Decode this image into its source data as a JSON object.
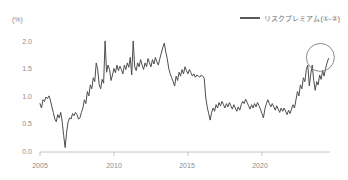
{
  "chart_data": {
    "type": "line",
    "title": "",
    "subtitle": "",
    "xlabel": "",
    "ylabel": "(%)",
    "yunit_label": "(%)",
    "grid": false,
    "legend_position": "top-right",
    "xlim": [
      2005.0,
      2024.6
    ],
    "ylim": [
      0.0,
      2.2
    ],
    "ytick_labels": [
      "0.0",
      "0.5",
      "1.0",
      "1.5",
      "2.0"
    ],
    "ytick_values": [
      0.0,
      0.5,
      1.0,
      1.5,
      2.0
    ],
    "xtick_labels": [
      "2005",
      "2010",
      "2015",
      "2020"
    ],
    "xtick_values": [
      2005,
      2010,
      2015,
      2020
    ],
    "series": [
      {
        "name": "リスクプレミアム(①-②)",
        "color": "#4d4d4d",
        "x": [
          2005.0,
          2005.1,
          2005.2,
          2005.3,
          2005.4,
          2005.5,
          2005.6,
          2005.7,
          2005.8,
          2005.9,
          2006.0,
          2006.1,
          2006.2,
          2006.3,
          2006.4,
          2006.5,
          2006.6,
          2006.7,
          2006.8,
          2006.9,
          2007.0,
          2007.1,
          2007.2,
          2007.3,
          2007.4,
          2007.5,
          2007.6,
          2007.7,
          2007.8,
          2007.9,
          2008.0,
          2008.1,
          2008.2,
          2008.3,
          2008.4,
          2008.5,
          2008.6,
          2008.7,
          2008.8,
          2008.9,
          2009.0,
          2009.1,
          2009.2,
          2009.3,
          2009.4,
          2009.5,
          2009.6,
          2009.7,
          2009.8,
          2009.9,
          2010.0,
          2010.1,
          2010.2,
          2010.3,
          2010.4,
          2010.5,
          2010.6,
          2010.7,
          2010.8,
          2010.9,
          2011.0,
          2011.1,
          2011.2,
          2011.3,
          2011.4,
          2011.5,
          2011.6,
          2011.7,
          2011.8,
          2011.9,
          2012.0,
          2012.1,
          2012.2,
          2012.3,
          2012.4,
          2012.5,
          2012.6,
          2012.7,
          2012.8,
          2012.9,
          2013.0,
          2013.1,
          2013.2,
          2013.3,
          2013.4,
          2013.5,
          2013.6,
          2013.7,
          2013.8,
          2013.9,
          2014.0,
          2014.1,
          2014.2,
          2014.3,
          2014.4,
          2014.5,
          2014.6,
          2014.7,
          2014.8,
          2014.9,
          2015.0,
          2015.1,
          2015.2,
          2015.3,
          2015.4,
          2015.5,
          2015.6,
          2015.7,
          2015.8,
          2015.9,
          2016.0,
          2016.1,
          2016.2,
          2016.3,
          2016.4,
          2016.5,
          2016.6,
          2016.7,
          2016.8,
          2016.9,
          2017.0,
          2017.1,
          2017.2,
          2017.3,
          2017.4,
          2017.5,
          2017.6,
          2017.7,
          2017.8,
          2017.9,
          2018.0,
          2018.1,
          2018.2,
          2018.3,
          2018.4,
          2018.5,
          2018.6,
          2018.7,
          2018.8,
          2018.9,
          2019.0,
          2019.1,
          2019.2,
          2019.3,
          2019.4,
          2019.5,
          2019.6,
          2019.7,
          2019.8,
          2019.9,
          2020.0,
          2020.1,
          2020.2,
          2020.3,
          2020.4,
          2020.5,
          2020.6,
          2020.7,
          2020.8,
          2020.9,
          2021.0,
          2021.1,
          2021.2,
          2021.3,
          2021.4,
          2021.5,
          2021.6,
          2021.7,
          2021.8,
          2021.9,
          2022.0,
          2022.1,
          2022.2,
          2022.3,
          2022.4,
          2022.5,
          2022.6,
          2022.7,
          2022.8,
          2022.9,
          2023.0,
          2023.1,
          2023.2,
          2023.3,
          2023.4,
          2023.5,
          2023.6,
          2023.7,
          2023.8,
          2023.9,
          2024.0,
          2024.1,
          2024.2,
          2024.3,
          2024.4,
          2024.5
        ],
        "values": [
          0.88,
          0.8,
          0.95,
          0.92,
          1.0,
          0.97,
          1.02,
          0.95,
          0.82,
          0.72,
          0.6,
          0.55,
          0.68,
          0.62,
          0.72,
          0.55,
          0.3,
          0.08,
          0.36,
          0.55,
          0.62,
          0.6,
          0.7,
          0.66,
          0.72,
          0.68,
          0.6,
          0.62,
          0.72,
          0.8,
          0.95,
          0.88,
          1.1,
          1.02,
          1.22,
          1.15,
          1.35,
          1.28,
          1.62,
          1.5,
          1.22,
          1.15,
          1.32,
          1.25,
          2.02,
          1.45,
          1.58,
          1.5,
          1.3,
          1.4,
          1.52,
          1.44,
          1.58,
          1.48,
          1.56,
          1.5,
          1.42,
          1.58,
          1.5,
          1.62,
          1.54,
          1.72,
          1.4,
          2.02,
          1.55,
          1.48,
          1.62,
          1.55,
          1.68,
          1.58,
          1.5,
          1.62,
          1.55,
          1.7,
          1.62,
          1.55,
          1.68,
          1.6,
          1.72,
          1.64,
          1.58,
          1.7,
          1.8,
          1.9,
          1.98,
          1.82,
          1.7,
          1.52,
          1.42,
          1.35,
          1.28,
          1.2,
          1.38,
          1.3,
          1.45,
          1.38,
          1.5,
          1.42,
          1.55,
          1.48,
          1.42,
          1.5,
          1.44,
          1.38,
          1.42,
          1.36,
          1.4,
          1.38,
          1.36,
          1.4,
          1.38,
          1.34,
          1.0,
          0.82,
          0.7,
          0.58,
          0.72,
          0.8,
          0.74,
          0.86,
          0.8,
          0.9,
          0.84,
          0.92,
          0.86,
          0.8,
          0.88,
          0.82,
          0.9,
          0.84,
          0.78,
          0.86,
          0.8,
          0.74,
          0.82,
          0.76,
          0.86,
          0.92,
          0.88,
          0.96,
          0.9,
          0.84,
          0.78,
          0.86,
          0.8,
          0.88,
          0.82,
          0.9,
          0.84,
          0.78,
          0.7,
          0.62,
          0.78,
          0.88,
          0.95,
          0.88,
          0.82,
          0.88,
          0.82,
          0.76,
          0.84,
          0.78,
          0.72,
          0.8,
          0.74,
          0.8,
          0.74,
          0.68,
          0.76,
          0.7,
          0.78,
          0.86,
          0.8,
          0.95,
          1.1,
          1.02,
          1.22,
          1.15,
          1.35,
          1.28,
          1.5,
          1.58,
          1.2,
          1.42,
          1.58,
          1.3,
          1.12,
          1.28,
          1.22,
          1.4,
          1.32,
          1.48,
          1.38,
          1.52,
          1.62,
          1.7
        ]
      }
    ],
    "annotations": [
      {
        "type": "ellipse",
        "name": "highlight-circle",
        "center_x": 2023.95,
        "center_y": 1.72,
        "radius_px": 14,
        "color": "#8c8c8c"
      }
    ]
  },
  "legend": {
    "items": [
      {
        "label": "リスクプレミアム(①-②)",
        "color": "#4d4d4d"
      }
    ]
  },
  "axes": {
    "y_unit": "(%)",
    "y_ticks": [
      "2.0",
      "1.5",
      "1.0",
      "0.5",
      "0.0"
    ],
    "x_ticks": [
      "2005",
      "2010",
      "2015",
      "2020"
    ]
  }
}
